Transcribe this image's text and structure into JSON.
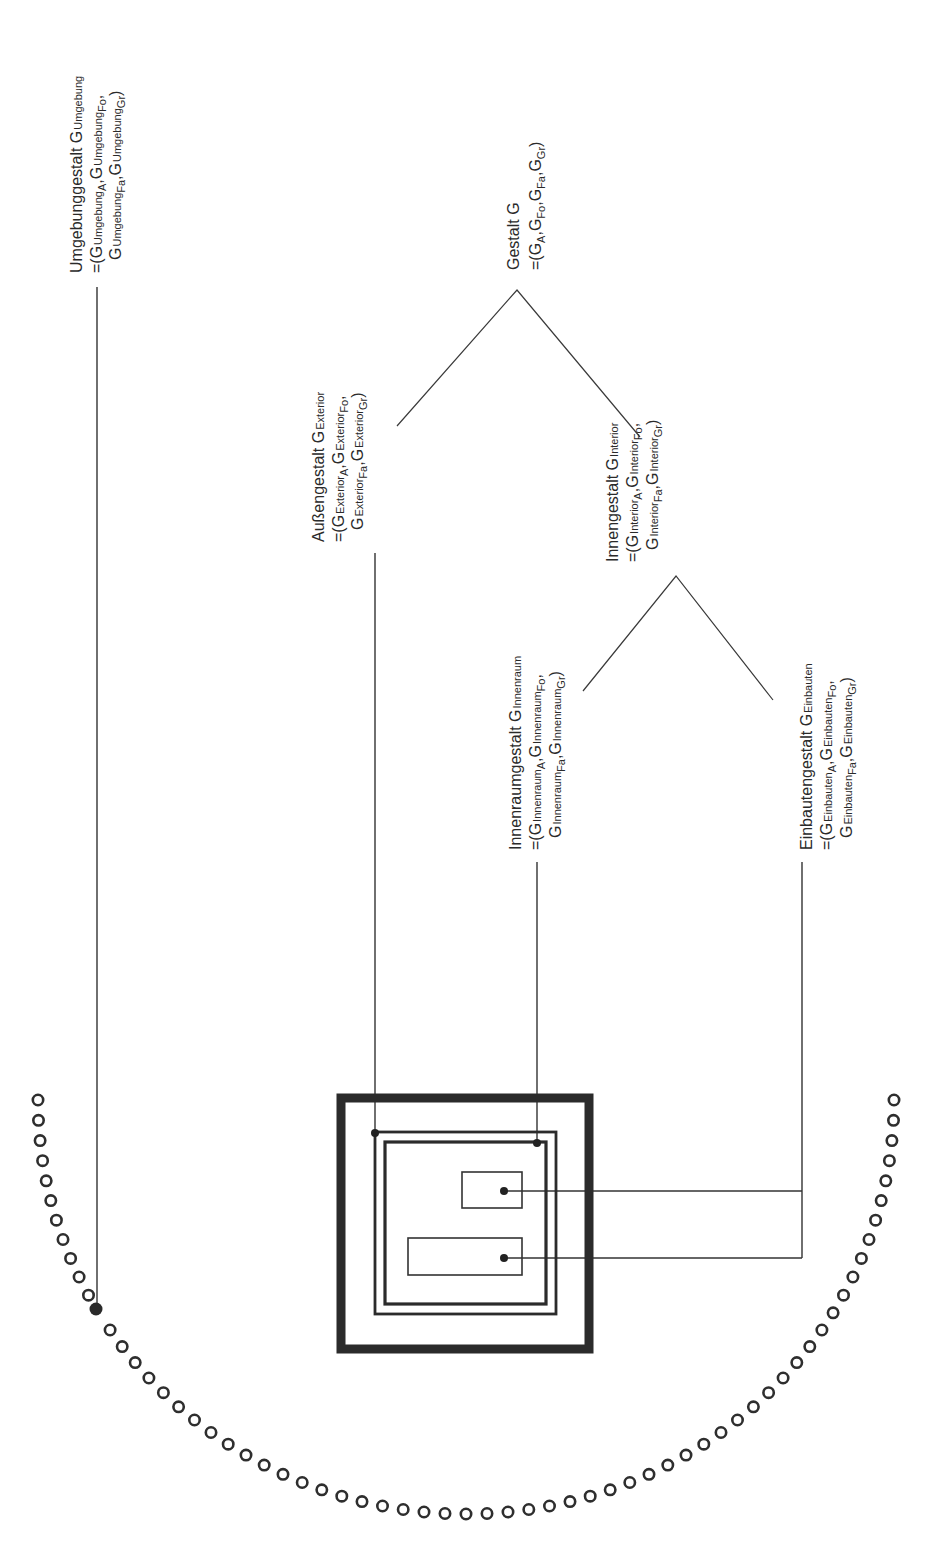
{
  "diagram": {
    "orientation": "rotated -90deg (text reads bottom-to-top)",
    "colors": {
      "ink": "#2e2e2e",
      "background": "#ffffff"
    },
    "nodes": [
      {
        "id": "umgebung",
        "title": "Umgebunggestalt G",
        "title_sub": "Umgebung",
        "formula_line1": "=(G Umgebung_A, G Umgebung_Fo,",
        "formula_line2": "G Umgebung_Fa, G Umgebung_Gr)",
        "parts": {
          "l1_title": "Umgebunggestalt G",
          "l1_sub": "Umgebung",
          "l2_a": "=(G",
          "l2_b": "Umgebung",
          "l2_s1": "A",
          "l2_c": ",G",
          "l2_d": "Umgebung",
          "l2_s2": "Fo",
          "l2_e": ",",
          "l3_a": "G",
          "l3_b": "Umgebung",
          "l3_s1": "Fa",
          "l3_c": ",G",
          "l3_d": "Umgebung",
          "l3_s2": "Gr",
          "l3_e": ")"
        }
      },
      {
        "id": "gestalt",
        "title": "Gestalt G",
        "formula": "=(G_A, G_Fo, G_Fa, G_Gr)",
        "parts": {
          "l1_title": "Gestalt G",
          "l2_a": "=(G",
          "l2_s1": "A",
          "l2_b": ",G",
          "l2_s2": "Fo",
          "l2_c": ",G",
          "l2_s3": "Fa",
          "l2_d": ",G",
          "l2_s4": "Gr",
          "l2_e": ")"
        }
      },
      {
        "id": "exterior",
        "title": "Außengestalt G",
        "title_sub": "Exterior",
        "parts": {
          "l1_title": "Außengestalt G",
          "l1_sub": "Exterior",
          "l2_a": "=(G",
          "l2_b": "Exterior",
          "l2_s1": "A",
          "l2_c": ",G",
          "l2_d": "Exterior",
          "l2_s2": "Fo",
          "l2_e": ",",
          "l3_a": "G",
          "l3_b": "Exterior",
          "l3_s1": "Fa",
          "l3_c": ",G",
          "l3_d": "Exterior",
          "l3_s2": "Gr",
          "l3_e": ")"
        }
      },
      {
        "id": "interior",
        "title": "Innengestalt G",
        "title_sub": "Interior",
        "parts": {
          "l1_title": "Innengestalt  G",
          "l1_sub": "Interior",
          "l2_a": "=(G",
          "l2_b": "Interior",
          "l2_s1": "A",
          "l2_c": ",G",
          "l2_d": "Interior",
          "l2_s2": "Fo",
          "l2_e": ",",
          "l3_a": "G",
          "l3_b": "Interior",
          "l3_s1": "Fa",
          "l3_c": ",G",
          "l3_d": "Interior",
          "l3_s2": "Gr",
          "l3_e": ")"
        }
      },
      {
        "id": "innenraum",
        "title": "Innenraumgestalt G",
        "title_sub": "Innenraum",
        "parts": {
          "l1_title": "Innenraumgestalt  G",
          "l1_sub": "Innenraum",
          "l2_a": "=(G",
          "l2_b": "Innenraum",
          "l2_s1": "A",
          "l2_c": ",G",
          "l2_d": "Innenraum",
          "l2_s2": "Fo",
          "l2_e": ",",
          "l3_a": "G",
          "l3_b": "Innenraum",
          "l3_s1": "Fa",
          "l3_c": ",G",
          "l3_d": "Innenraum",
          "l3_s2": "Gr",
          "l3_e": ")"
        }
      },
      {
        "id": "einbauten",
        "title": "Einbautengestalt G",
        "title_sub": "Einbauten",
        "parts": {
          "l1_title": "Einbautengestalt    G",
          "l1_sub": "Einbauten",
          "l2_a": "=(G",
          "l2_b": "Einbauten",
          "l2_s1": "A",
          "l2_c": ",G",
          "l2_d": "Einbauten",
          "l2_s2": "Fo",
          "l2_e": ",",
          "l3_a": "G",
          "l3_b": "Einbauten",
          "l3_s1": "Fa",
          "l3_c": ",G",
          "l3_d": "Einbauten",
          "l3_s2": "Gr",
          "l3_e": ")"
        }
      }
    ],
    "tree": [
      {
        "parent": "gestalt",
        "children": [
          "exterior",
          "interior"
        ]
      },
      {
        "parent": "interior",
        "children": [
          "innenraum",
          "einbauten"
        ]
      }
    ],
    "building_symbol": {
      "outer_frame": "thick square",
      "exterior_boundary": "double-line square",
      "innenraum_boundary": "inner square",
      "einbauten": [
        "small rectangle (upper)",
        "long rectangle (lower)"
      ]
    },
    "environment_ring": {
      "description": "semicircular arc of small hollow circles surrounding the building",
      "highlighted_point": "filled dot connected to Umgebung label"
    }
  }
}
